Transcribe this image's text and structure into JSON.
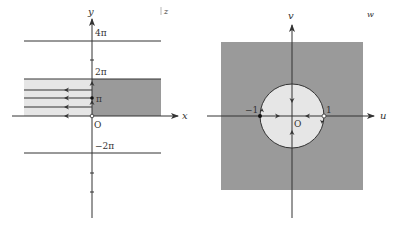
{
  "left_plane": {
    "corner_label": "z",
    "x_axis_label": "x",
    "y_axis_label": "y",
    "origin_label": "O",
    "tick_labels": {
      "four_pi": "4π",
      "two_pi": "2π",
      "pi": "π",
      "neg_two_pi": "−2π"
    }
  },
  "right_plane": {
    "corner_label": "w",
    "u_axis_label": "u",
    "v_axis_label": "v",
    "origin_label": "O",
    "point_labels": {
      "neg_one": "−1",
      "one": "1"
    }
  },
  "colors": {
    "light_region": "#e6e6e6",
    "dark_region": "#9a9a9a",
    "line": "#333333"
  }
}
